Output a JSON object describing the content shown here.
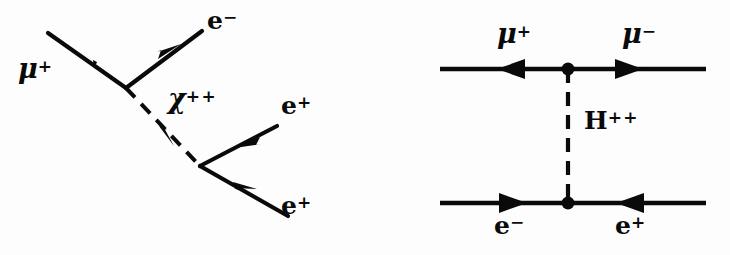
{
  "figure": {
    "name": "feynman-diagram-pair",
    "background_color": "#fdfdfd",
    "ink_color": "#0a0a0a",
    "width": 730,
    "height": 255
  },
  "diagram_left": {
    "name": "muon-decay-doubly-charged-scalar",
    "labels": {
      "incoming_muon": {
        "symbol": "μ",
        "charge": "+"
      },
      "outgoing_electron": {
        "symbol": "e",
        "charge": "−"
      },
      "mediator": {
        "symbol": "χ",
        "charge": "++"
      },
      "outgoing_positron_upper": {
        "symbol": "e",
        "charge": "+"
      },
      "outgoing_positron_lower": {
        "symbol": "e",
        "charge": "+"
      }
    },
    "propagator_style": "dashed",
    "vertices": 2
  },
  "diagram_right": {
    "name": "mu-mu-to-e-e-h-plusplus-exchange",
    "labels": {
      "top_left": {
        "symbol": "μ",
        "charge": "+"
      },
      "top_right": {
        "symbol": "μ",
        "charge": "−"
      },
      "mediator": {
        "symbol": "H",
        "charge": "++"
      },
      "bottom_left": {
        "symbol": "e",
        "charge": "−"
      },
      "bottom_right": {
        "symbol": "e",
        "charge": "+"
      }
    },
    "propagator_style": "dashed",
    "vertices": 2
  }
}
